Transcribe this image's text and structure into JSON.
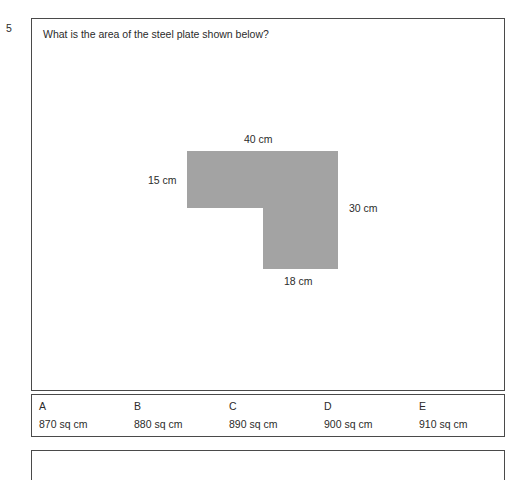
{
  "question": {
    "number": "5",
    "text": "What is the area of the steel plate shown below?"
  },
  "figure": {
    "shape_name": "steel-plate-l-shape",
    "fill_color": "#a3a3a3",
    "dimensions": {
      "top": "40 cm",
      "left": "15 cm",
      "right": "30 cm",
      "bottom": "18 cm"
    }
  },
  "answers": [
    {
      "letter": "A",
      "value": "870 sq cm"
    },
    {
      "letter": "B",
      "value": "880 sq cm"
    },
    {
      "letter": "C",
      "value": "890 sq cm"
    },
    {
      "letter": "D",
      "value": "900 sq cm"
    },
    {
      "letter": "E",
      "value": "910 sq cm"
    }
  ]
}
